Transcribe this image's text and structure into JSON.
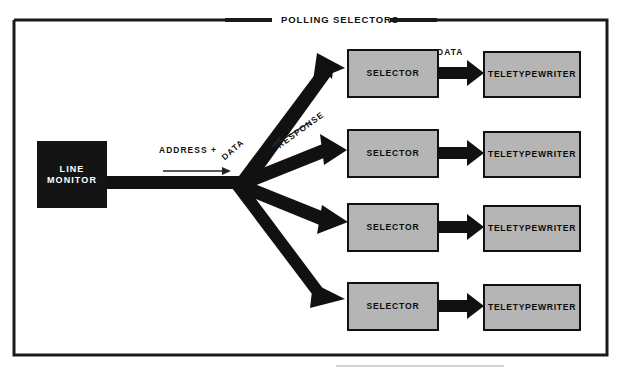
{
  "figure": {
    "title": "POLLING SELECTORS",
    "frame_color": "#1a1a1a",
    "background": "#ffffff"
  },
  "palette": {
    "box_fill": "#b5b5b5",
    "box_border": "#111111",
    "monitor_fill": "#141414",
    "monitor_text": "#ffffff",
    "arrow_fill": "#111111",
    "text": "#111111"
  },
  "source_node": {
    "name": "line-monitor",
    "label_line1": "LINE",
    "label_line2": "MONITOR"
  },
  "flow_labels": {
    "address": "ADDRESS +",
    "address_data": "DATA",
    "response": "RESPONSE",
    "data": "DATA"
  },
  "rows": [
    {
      "selector": "SELECTOR",
      "terminal": "TELETYPEWRITER",
      "data_label": "DATA"
    },
    {
      "selector": "SELECTOR",
      "terminal": "TELETYPEWRITER",
      "data_label": ""
    },
    {
      "selector": "SELECTOR",
      "terminal": "TELETYPEWRITER",
      "data_label": ""
    },
    {
      "selector": "SELECTOR",
      "terminal": "TELETYPEWRITER",
      "data_label": ""
    }
  ]
}
